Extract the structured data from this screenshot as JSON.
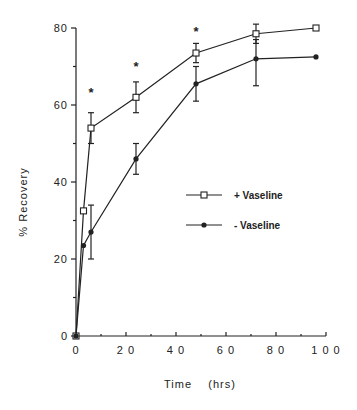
{
  "chart_data": {
    "type": "line",
    "title": "",
    "xlabel": "Time    (hrs)",
    "ylabel": "% Recovery",
    "xlim": [
      0,
      100
    ],
    "ylim": [
      0,
      80
    ],
    "x_ticks": [
      0,
      20,
      40,
      60,
      80,
      100
    ],
    "x_tick_labels": [
      "0",
      "2 0",
      "4 0",
      "6 0",
      "8 0",
      "1 0 0"
    ],
    "y_ticks": [
      0,
      20,
      40,
      60,
      80
    ],
    "y_tick_labels": [
      "0",
      "20",
      "40",
      "60",
      "80"
    ],
    "grid": false,
    "legend_position": "center-right",
    "series": [
      {
        "name": "+ Vaseline",
        "marker": "open-square",
        "x": [
          0,
          3,
          6,
          24,
          48,
          72,
          96
        ],
        "values": [
          0,
          32.5,
          54,
          62,
          73.5,
          78.5,
          80
        ],
        "err_low": [
          0,
          0,
          50,
          58,
          71,
          76,
          80
        ],
        "err_high": [
          0,
          0,
          58,
          66,
          76,
          81,
          80
        ]
      },
      {
        "name": "- Vaseline",
        "marker": "filled-diamond",
        "x": [
          0,
          3,
          6,
          24,
          48,
          72,
          96
        ],
        "values": [
          0,
          23.5,
          27,
          46,
          65.5,
          72,
          72.5
        ],
        "err_low": [
          0,
          0,
          20,
          42,
          61,
          65,
          72.5
        ],
        "err_high": [
          0,
          0,
          34,
          50,
          70,
          77,
          72.5
        ]
      }
    ],
    "annotations": [
      {
        "text": "*",
        "x": 6,
        "y": 63
      },
      {
        "text": "*",
        "x": 24,
        "y": 70
      },
      {
        "text": "*",
        "x": 48,
        "y": 79
      }
    ]
  }
}
